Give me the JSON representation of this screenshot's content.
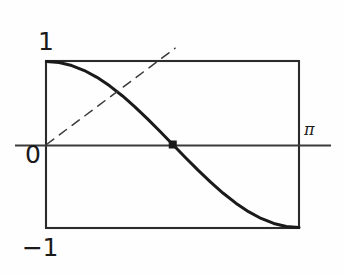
{
  "figure": {
    "title": "",
    "background_color": "#fefefe",
    "ink_color": "#1a1a1a"
  },
  "labels": {
    "y_max": "1",
    "y_origin": "0",
    "y_min": "−1",
    "x_end": "π"
  },
  "chart_data": {
    "type": "line",
    "title": "",
    "xlabel": "",
    "ylabel": "",
    "xlim": [
      0,
      3.14159
    ],
    "ylim": [
      -1,
      1
    ],
    "grid": false,
    "legend": null,
    "xticks": [
      0,
      3.14159
    ],
    "xticklabels": [
      "0",
      "π"
    ],
    "yticks": [
      -1,
      0,
      1
    ],
    "yticklabels": [
      "−1",
      "0",
      "1"
    ],
    "series": [
      {
        "name": "cos(x)",
        "style": "solid",
        "linewidth": 3,
        "color": "#1a1a1a",
        "x": [
          0,
          0.15708,
          0.31416,
          0.47124,
          0.62832,
          0.7854,
          0.94248,
          1.09956,
          1.25664,
          1.41372,
          1.5708,
          1.72788,
          1.88496,
          2.04204,
          2.19911,
          2.35619,
          2.51327,
          2.67035,
          2.82743,
          2.98451,
          3.14159
        ],
        "y": [
          1.0,
          0.98769,
          0.95106,
          0.89101,
          0.80902,
          0.70711,
          0.58779,
          0.45399,
          0.30902,
          0.15643,
          0.0,
          -0.15643,
          -0.30902,
          -0.45399,
          -0.58779,
          -0.70711,
          -0.80902,
          -0.89101,
          -0.95106,
          -0.98769,
          -1.0
        ]
      },
      {
        "name": "tangent-line-at-origin",
        "style": "dashed",
        "linewidth": 1.5,
        "color": "#3a3a3a",
        "x": [
          0,
          1.6
        ],
        "y": [
          0,
          1.16
        ]
      }
    ],
    "markers": [
      {
        "name": "zero-crossing",
        "x": 1.5708,
        "y": 0,
        "label": "",
        "shape": "square-dot",
        "color": "#1a1a1a"
      }
    ],
    "annotations": [
      {
        "name": "bounding-box",
        "type": "rect",
        "x0": 0,
        "y0": -1,
        "x1": 3.14159,
        "y1": 1
      },
      {
        "name": "x-axis-line",
        "type": "hline",
        "y": 0
      }
    ]
  }
}
